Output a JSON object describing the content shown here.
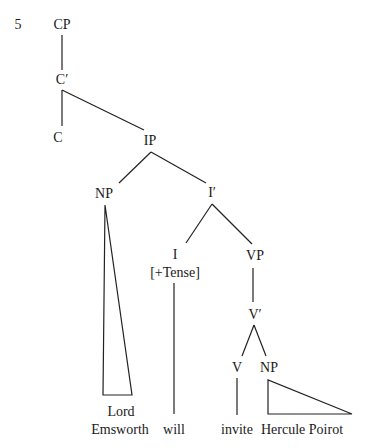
{
  "example_number": "5",
  "nodes": {
    "cp": {
      "label": "CP",
      "x": 62,
      "y": 25
    },
    "c_bar": {
      "label": "C′",
      "x": 62,
      "y": 80
    },
    "c": {
      "label": "C",
      "x": 58,
      "y": 138
    },
    "ip": {
      "label": "IP",
      "x": 150,
      "y": 141
    },
    "np_subj": {
      "label": "NP",
      "x": 104,
      "y": 194
    },
    "i_bar": {
      "label": "I′",
      "x": 212,
      "y": 193
    },
    "i": {
      "label": "I",
      "x": 175,
      "y": 255
    },
    "i_feature": {
      "label": "[+Tense]",
      "x": 175,
      "y": 273
    },
    "vp": {
      "label": "VP",
      "x": 255,
      "y": 256
    },
    "v_bar": {
      "label": "V′",
      "x": 255,
      "y": 315
    },
    "v": {
      "label": "V",
      "x": 237,
      "y": 368
    },
    "np_obj": {
      "label": "NP",
      "x": 269,
      "y": 368
    }
  },
  "leaves": {
    "lord": {
      "label": "Lord",
      "x": 121,
      "y": 412
    },
    "emsworth": {
      "label": "Emsworth",
      "x": 120,
      "y": 430
    },
    "will": {
      "label": "will",
      "x": 174,
      "y": 430
    },
    "invite": {
      "label": "invite",
      "x": 237,
      "y": 430
    },
    "hercule_poirot": {
      "label": "Hercule Poirot",
      "x": 302,
      "y": 430
    }
  },
  "edges": [
    {
      "from": "cp",
      "to": "c_bar",
      "x1": 62,
      "y1": 35,
      "x2": 62,
      "y2": 70
    },
    {
      "from": "c_bar",
      "to": "c",
      "x1": 62,
      "y1": 90,
      "x2": 62,
      "y2": 126
    },
    {
      "from": "c_bar",
      "to": "ip",
      "x1": 62,
      "y1": 90,
      "x2": 144,
      "y2": 130
    },
    {
      "from": "ip",
      "to": "np_subj",
      "x1": 151,
      "y1": 152,
      "x2": 119,
      "y2": 183
    },
    {
      "from": "ip",
      "to": "i_bar",
      "x1": 151,
      "y1": 152,
      "x2": 206,
      "y2": 183
    },
    {
      "from": "i_bar",
      "to": "i",
      "x1": 212,
      "y1": 204,
      "x2": 186,
      "y2": 243
    },
    {
      "from": "i_bar",
      "to": "vp",
      "x1": 212,
      "y1": 204,
      "x2": 252,
      "y2": 244
    },
    {
      "from": "i",
      "to": "will",
      "x1": 174,
      "y1": 283,
      "x2": 174,
      "y2": 414
    },
    {
      "from": "vp",
      "to": "v_bar",
      "x1": 253,
      "y1": 268,
      "x2": 253,
      "y2": 302
    },
    {
      "from": "v_bar",
      "to": "v",
      "x1": 254,
      "y1": 325,
      "x2": 242,
      "y2": 356
    },
    {
      "from": "v_bar",
      "to": "np_obj",
      "x1": 254,
      "y1": 325,
      "x2": 266,
      "y2": 356
    },
    {
      "from": "v",
      "to": "invite",
      "x1": 237,
      "y1": 378,
      "x2": 237,
      "y2": 415
    }
  ],
  "triangles": [
    {
      "node": "np_subj",
      "points": "105,205 103,395 132,395"
    },
    {
      "node": "np_obj",
      "points": "268,380 268,414 352,414"
    }
  ]
}
